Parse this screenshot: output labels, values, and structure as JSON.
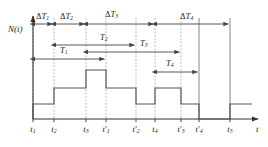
{
  "figure": {
    "type": "timing-step-diagram",
    "y_axis_label": "N(t)",
    "x_axis_label": "t",
    "background": "#ffffff",
    "line_color": "#555555",
    "axis_color": "#333333",
    "dotted_color": "#999999",
    "text_color": "#1a1a1a"
  },
  "x_ticks": [
    {
      "id": "t1",
      "base": "t",
      "sub": "1",
      "prime": false,
      "x": 33
    },
    {
      "id": "t2",
      "base": "t",
      "sub": "2",
      "prime": false,
      "x": 54
    },
    {
      "id": "t3",
      "base": "t",
      "sub": "3",
      "prime": false,
      "x": 86
    },
    {
      "id": "t1p",
      "base": "t",
      "sub": "1",
      "prime": true,
      "x": 106
    },
    {
      "id": "t2p",
      "base": "t",
      "sub": "2",
      "prime": true,
      "x": 136
    },
    {
      "id": "t4",
      "base": "t",
      "sub": "4",
      "prime": false,
      "x": 155
    },
    {
      "id": "t3p",
      "base": "t",
      "sub": "3",
      "prime": true,
      "x": 181
    },
    {
      "id": "t4p",
      "base": "t",
      "sub": "4",
      "prime": true,
      "x": 199
    },
    {
      "id": "t5",
      "base": "t",
      "sub": "5",
      "prime": false,
      "x": 230
    }
  ],
  "delta_intervals": [
    {
      "id": "dT1",
      "base": "ΔT",
      "sub": "1",
      "from": 33,
      "to": 54,
      "label_x": 36,
      "label_y": 11,
      "arrow_y": 24
    },
    {
      "id": "dT2",
      "base": "ΔT",
      "sub": "2",
      "from": 54,
      "to": 86,
      "label_x": 60,
      "label_y": 11,
      "arrow_y": 24
    },
    {
      "id": "dT3",
      "base": "ΔT",
      "sub": "3",
      "from": 86,
      "to": 155,
      "label_x": 105,
      "label_y": 9,
      "arrow_y": 24
    },
    {
      "id": "dT4",
      "base": "ΔT",
      "sub": "4",
      "from": 155,
      "to": 230,
      "label_x": 180,
      "label_y": 11,
      "arrow_y": 24
    }
  ],
  "t_intervals": [
    {
      "id": "T1",
      "base": "T",
      "sub": "1",
      "from": 33,
      "to": 106,
      "label_x": 60,
      "label_y": 45,
      "arrow_y": 59
    },
    {
      "id": "T2",
      "base": "T",
      "sub": "2",
      "from": 54,
      "to": 136,
      "label_x": 100,
      "label_y": 32,
      "arrow_y": 45
    },
    {
      "id": "T3",
      "base": "T",
      "sub": "3",
      "from": 86,
      "to": 181,
      "label_x": 140,
      "label_y": 38,
      "arrow_y": 52
    },
    {
      "id": "T4",
      "base": "T",
      "sub": "4",
      "from": 155,
      "to": 199,
      "label_x": 166,
      "label_y": 58,
      "arrow_y": 72
    }
  ],
  "step_levels": {
    "baseline_y": 119,
    "level_1_y": 104,
    "level_2_y": 88,
    "level_3_y": 70,
    "note": "N(t) staircase; y decreases upward"
  },
  "step_path": [
    {
      "x": 33,
      "y": 119,
      "to_y": 104
    },
    {
      "x": 54,
      "y": 104,
      "to_y": 88
    },
    {
      "x": 86,
      "y": 88,
      "to_y": 70
    },
    {
      "x": 106,
      "y": 70,
      "to_y": 88
    },
    {
      "x": 136,
      "y": 88,
      "to_y": 104
    },
    {
      "x": 155,
      "y": 104,
      "to_y": 88
    },
    {
      "x": 181,
      "y": 88,
      "to_y": 104
    },
    {
      "x": 199,
      "y": 104,
      "to_y": 119
    },
    {
      "x": 230,
      "y": 119,
      "to_y": 104
    },
    {
      "x": 252,
      "y": 104,
      "to_y": 104
    }
  ],
  "axes": {
    "origin_x": 33,
    "origin_y": 119,
    "y_top": 12,
    "x_right": 258,
    "y_label_x": 8,
    "y_label_y": 24,
    "x_label_x": 256,
    "x_label_y": 124
  }
}
